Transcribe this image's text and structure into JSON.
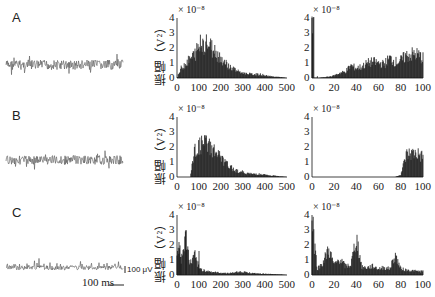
{
  "figure": {
    "panels": [
      {
        "label": "A"
      },
      {
        "label": "B"
      },
      {
        "label": "C"
      }
    ],
    "ylabel": "振幅（V²）",
    "exponent": "× 10⁻⁸",
    "yticks": [
      "0",
      "1",
      "2",
      "3",
      "4"
    ],
    "xticks_wide": [
      "0",
      "100",
      "200",
      "300",
      "400",
      "500"
    ],
    "xticks_narrow": [
      "0",
      "20",
      "40",
      "60",
      "80",
      "100"
    ],
    "scalebar": {
      "time": "100 ms",
      "voltage": "100 μV"
    }
  },
  "chart_data": [
    {
      "panel": "A-signal",
      "type": "line",
      "title": "Raw EMG-like signal A",
      "description": "Noise-like oscillation around baseline"
    },
    {
      "panel": "A-spectrum-wide",
      "type": "bar",
      "xlabel": "",
      "ylabel": "振幅（V²）",
      "ylim": [
        0,
        4
      ],
      "xlim": [
        0,
        500
      ],
      "y_scale": "× 10⁻⁸",
      "x": [
        0,
        20,
        40,
        60,
        80,
        100,
        120,
        140,
        160,
        180,
        200,
        220,
        240,
        260,
        280,
        300,
        320,
        340,
        360,
        380,
        400,
        420,
        440,
        460,
        480,
        500
      ],
      "values": [
        0,
        0.8,
        1.2,
        1.5,
        1.9,
        2.5,
        2.8,
        2.7,
        2.4,
        2.0,
        1.6,
        1.2,
        0.9,
        0.7,
        0.5,
        0.4,
        0.35,
        0.3,
        0.3,
        0.25,
        0.2,
        0.15,
        0.1,
        0.08,
        0.05,
        0
      ]
    },
    {
      "panel": "A-spectrum-narrow",
      "type": "bar",
      "ylabel": "",
      "ylim": [
        0,
        4
      ],
      "xlim": [
        0,
        100
      ],
      "y_scale": "× 10⁻⁸",
      "x": [
        0,
        5,
        10,
        15,
        20,
        25,
        30,
        35,
        40,
        45,
        50,
        55,
        60,
        65,
        70,
        75,
        80,
        85,
        90,
        95,
        100
      ],
      "values": [
        4.1,
        0,
        0.05,
        0.1,
        0.2,
        0.4,
        0.5,
        1.0,
        0.8,
        0.9,
        1.2,
        1.3,
        1.2,
        1.1,
        1.6,
        1.3,
        1.4,
        1.8,
        1.9,
        1.9,
        1.6
      ]
    },
    {
      "panel": "B-signal",
      "type": "line",
      "title": "Raw signal B (filtered)"
    },
    {
      "panel": "B-spectrum-wide",
      "type": "bar",
      "ylim": [
        0,
        4
      ],
      "xlim": [
        0,
        500
      ],
      "y_scale": "× 10⁻⁸",
      "x": [
        0,
        20,
        40,
        60,
        80,
        100,
        120,
        140,
        160,
        180,
        200,
        220,
        240,
        260,
        280,
        300,
        320,
        340,
        360,
        380,
        400,
        420,
        440,
        460,
        480,
        500
      ],
      "values": [
        0,
        0,
        0,
        0,
        2.0,
        2.4,
        2.7,
        2.6,
        2.3,
        1.9,
        1.5,
        1.1,
        0.8,
        0.6,
        0.45,
        0.35,
        0.3,
        0.25,
        0.25,
        0.2,
        0.18,
        0.12,
        0.1,
        0.07,
        0.04,
        0
      ]
    },
    {
      "panel": "B-spectrum-narrow",
      "type": "bar",
      "ylim": [
        0,
        4
      ],
      "xlim": [
        0,
        100
      ],
      "y_scale": "× 10⁻⁸",
      "x": [
        0,
        5,
        10,
        15,
        20,
        25,
        30,
        35,
        40,
        45,
        50,
        55,
        60,
        65,
        70,
        75,
        80,
        85,
        90,
        95,
        100
      ],
      "values": [
        0,
        0,
        0,
        0,
        0,
        0,
        0,
        0,
        0,
        0,
        0,
        0,
        0,
        0,
        0,
        0,
        0.2,
        1.8,
        1.9,
        1.9,
        1.6
      ]
    },
    {
      "panel": "C-signal",
      "type": "line",
      "title": "Raw signal C (rectified)"
    },
    {
      "panel": "C-spectrum-wide",
      "type": "bar",
      "ylim": [
        0,
        4
      ],
      "xlim": [
        0,
        500
      ],
      "y_scale": "× 10⁻⁸",
      "x": [
        0,
        20,
        40,
        60,
        80,
        100,
        120,
        140,
        160,
        180,
        200,
        220,
        240,
        260,
        280,
        300,
        320,
        340,
        360,
        380,
        400,
        420,
        440,
        460,
        480,
        500
      ],
      "values": [
        4.0,
        1.2,
        3.0,
        0.9,
        1.5,
        0.5,
        0.4,
        0.3,
        0.25,
        0.2,
        0.18,
        0.15,
        0.15,
        0.2,
        0.25,
        0.25,
        0.2,
        0.15,
        0.12,
        0.1,
        0.1,
        0.08,
        0.06,
        0.05,
        0.04,
        0
      ]
    },
    {
      "panel": "C-spectrum-narrow",
      "type": "bar",
      "ylim": [
        0,
        4
      ],
      "xlim": [
        0,
        100
      ],
      "y_scale": "× 10⁻⁸",
      "x": [
        0,
        5,
        10,
        15,
        20,
        25,
        30,
        35,
        40,
        45,
        50,
        55,
        60,
        65,
        70,
        75,
        80,
        85,
        90,
        95,
        100
      ],
      "values": [
        4.0,
        0.5,
        1.0,
        2.1,
        0.8,
        1.3,
        0.7,
        0.8,
        3.0,
        0.6,
        0.6,
        0.7,
        0.5,
        0.6,
        0.5,
        1.6,
        0.5,
        0.4,
        0.35,
        0.3,
        0.3
      ]
    }
  ]
}
